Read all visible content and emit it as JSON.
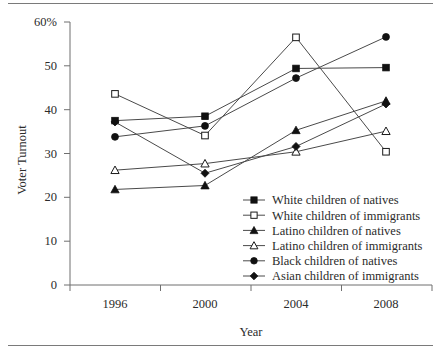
{
  "figure": {
    "has_top_rule": true,
    "has_bottom_rule": true,
    "rule_color": "#7a7a7a"
  },
  "chart_data": {
    "type": "line",
    "title": "",
    "xlabel": "Year",
    "ylabel": "Voter Turnout",
    "categories": [
      "1996",
      "2000",
      "2004",
      "2008"
    ],
    "x": [
      1996,
      2000,
      2004,
      2008
    ],
    "ylim": [
      0,
      60
    ],
    "yticks": [
      0,
      10,
      20,
      30,
      40,
      50,
      60
    ],
    "ytick_labels": [
      "0",
      "10",
      "20",
      "30",
      "40",
      "50",
      "60%"
    ],
    "grid": false,
    "legend_position": "inside lower-right",
    "line_color": "#4a4a4a",
    "marker_color": "#111111",
    "series": [
      {
        "name": "White children of natives",
        "marker": "filled-square",
        "values": [
          37.5,
          38.5,
          49.4,
          49.6
        ]
      },
      {
        "name": "White children of immigrants",
        "marker": "open-square",
        "values": [
          43.6,
          34.1,
          56.5,
          30.4
        ]
      },
      {
        "name": "Latino children of natives",
        "marker": "filled-triangle",
        "values": [
          21.8,
          22.7,
          35.3,
          42.0
        ]
      },
      {
        "name": "Latino children of immigrants",
        "marker": "open-triangle",
        "values": [
          26.2,
          27.7,
          30.4,
          35.1
        ]
      },
      {
        "name": "Black children of natives",
        "marker": "filled-circle",
        "values": [
          33.8,
          36.3,
          47.2,
          56.6
        ]
      },
      {
        "name": "Asian children of immigrants",
        "marker": "filled-diamond",
        "values": [
          37.2,
          25.5,
          31.6,
          41.3
        ]
      }
    ]
  }
}
